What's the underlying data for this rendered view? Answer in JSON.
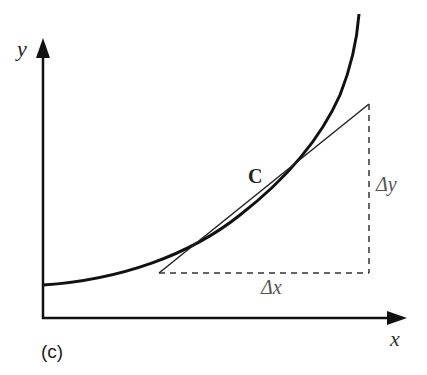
{
  "diagram": {
    "panel_label": "(c)",
    "axes": {
      "x_label": "x",
      "y_label": "y"
    },
    "curve_label": "C",
    "delta_x_label": "Δx",
    "delta_y_label": "Δy",
    "colors": {
      "ink": "#111111",
      "label_gray": "#555555",
      "background": "#ffffff"
    }
  }
}
